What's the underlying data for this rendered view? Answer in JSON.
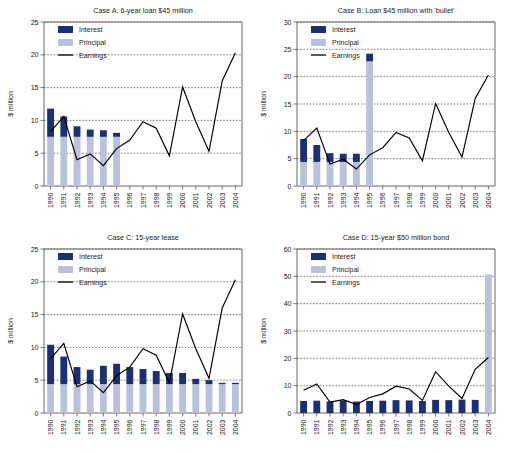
{
  "figure": {
    "panel_count": 4,
    "shared_ylabel": "$ million",
    "legend": {
      "interest_label": "Interest",
      "principal_label": "Principal",
      "earnings_label": "Earnings"
    },
    "colors": {
      "interest": "#1b2f73",
      "principal": "#b9c2da",
      "earnings": "#000000",
      "axis": "#555555",
      "grid": "#444444",
      "background": "#ffffff"
    }
  },
  "chart_data": [
    {
      "type": "bar",
      "id": "case-a",
      "title": "Case A: 6-year loan $45 million",
      "xlabel": "",
      "ylabel": "$ million",
      "ylim": [
        0,
        25
      ],
      "yticks": [
        0,
        5,
        10,
        15,
        20,
        25
      ],
      "grid": true,
      "legend_position": "top-left",
      "categories": [
        "1990",
        "1991",
        "1992",
        "1993",
        "1994",
        "1995",
        "1996",
        "1997",
        "1998",
        "1999",
        "2000",
        "2001",
        "2002",
        "2003",
        "2004"
      ],
      "series": [
        {
          "name": "Principal",
          "type": "bar",
          "values": [
            7.5,
            7.5,
            7.5,
            7.5,
            7.5,
            7.5,
            0,
            0,
            0,
            0,
            0,
            0,
            0,
            0,
            0
          ]
        },
        {
          "name": "Interest",
          "type": "bar",
          "values": [
            4.3,
            3.1,
            1.6,
            1.1,
            1.0,
            0.6,
            0,
            0,
            0,
            0,
            0,
            0,
            0,
            0,
            0
          ]
        },
        {
          "name": "Earnings",
          "type": "line",
          "values": [
            8.3,
            10.6,
            4.0,
            4.9,
            3.1,
            5.7,
            7.0,
            9.8,
            8.8,
            4.6,
            15.1,
            9.8,
            5.3,
            16.0,
            20.3
          ]
        }
      ]
    },
    {
      "type": "bar",
      "id": "case-b",
      "title": "Case B: Loan $45 million with 'bullet'",
      "xlabel": "",
      "ylabel": "$ million",
      "ylim": [
        0,
        30
      ],
      "yticks": [
        0,
        5,
        10,
        15,
        20,
        25,
        30
      ],
      "grid": true,
      "legend_position": "top-left",
      "categories": [
        "1990",
        "1991",
        "1992",
        "1993",
        "1994",
        "1995",
        "1996",
        "1997",
        "1998",
        "1999",
        "2000",
        "2001",
        "2002",
        "2003",
        "2004"
      ],
      "series": [
        {
          "name": "Principal",
          "type": "bar",
          "values": [
            4.4,
            4.4,
            4.4,
            4.4,
            4.4,
            22.8,
            0,
            0,
            0,
            0,
            0,
            0,
            0,
            0,
            0
          ]
        },
        {
          "name": "Interest",
          "type": "bar",
          "values": [
            4.2,
            3.1,
            1.6,
            1.5,
            1.5,
            1.4,
            0,
            0,
            0,
            0,
            0,
            0,
            0,
            0,
            0
          ]
        },
        {
          "name": "Earnings",
          "type": "line",
          "values": [
            8.3,
            10.6,
            4.0,
            4.9,
            3.1,
            5.7,
            7.0,
            9.8,
            8.8,
            4.6,
            15.1,
            9.8,
            5.3,
            16.0,
            20.3
          ]
        }
      ]
    },
    {
      "type": "bar",
      "id": "case-c",
      "title": "Case C: 15-year lease",
      "xlabel": "",
      "ylabel": "$ million",
      "ylim": [
        0,
        25
      ],
      "yticks": [
        0,
        5,
        10,
        15,
        20,
        25
      ],
      "grid": true,
      "legend_position": "top-left",
      "categories": [
        "1990",
        "1991",
        "1992",
        "1993",
        "1994",
        "1995",
        "1996",
        "1997",
        "1998",
        "1999",
        "2000",
        "2001",
        "2002",
        "2003",
        "2004"
      ],
      "series": [
        {
          "name": "Principal",
          "type": "bar",
          "values": [
            4.4,
            4.4,
            4.4,
            4.4,
            4.4,
            4.4,
            4.4,
            4.4,
            4.4,
            4.4,
            4.4,
            4.4,
            4.4,
            4.4,
            4.4
          ]
        },
        {
          "name": "Interest",
          "type": "bar",
          "values": [
            6.0,
            4.2,
            2.6,
            2.2,
            2.8,
            3.1,
            2.6,
            2.3,
            2.0,
            1.7,
            1.7,
            0.8,
            0.6,
            0.2,
            0.2
          ]
        },
        {
          "name": "Earnings",
          "type": "line",
          "values": [
            8.3,
            10.6,
            4.0,
            4.9,
            3.1,
            5.7,
            7.0,
            9.8,
            8.8,
            4.6,
            15.1,
            9.8,
            5.3,
            16.0,
            20.3
          ]
        }
      ]
    },
    {
      "type": "bar",
      "id": "case-d",
      "title": "Case D: 15-year $50 million bond",
      "xlabel": "",
      "ylabel": "$ million",
      "ylim": [
        0,
        60
      ],
      "yticks": [
        0,
        10,
        20,
        30,
        40,
        50,
        60
      ],
      "grid": true,
      "legend_position": "top-left",
      "categories": [
        "1990",
        "1991",
        "1992",
        "1993",
        "1994",
        "1995",
        "1996",
        "1997",
        "1998",
        "1999",
        "2000",
        "2001",
        "2002",
        "2003",
        "2004"
      ],
      "series": [
        {
          "name": "Principal",
          "type": "bar",
          "values": [
            0,
            0,
            0,
            0,
            0,
            0,
            0,
            0,
            0,
            0,
            0,
            0,
            0,
            0,
            50.7
          ]
        },
        {
          "name": "Interest",
          "type": "bar",
          "values": [
            4.4,
            4.5,
            4.2,
            4.6,
            4.2,
            4.4,
            4.5,
            4.7,
            4.6,
            4.4,
            4.8,
            4.7,
            4.9,
            4.8,
            0
          ]
        },
        {
          "name": "Earnings",
          "type": "line",
          "values": [
            8.3,
            10.6,
            4.0,
            4.9,
            3.1,
            5.7,
            7.0,
            9.8,
            8.8,
            4.6,
            15.1,
            9.8,
            5.3,
            16.0,
            20.3
          ]
        }
      ]
    }
  ]
}
